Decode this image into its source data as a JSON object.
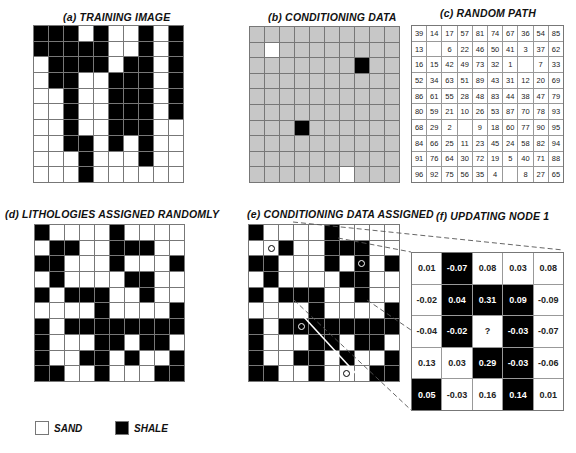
{
  "panels": {
    "a": {
      "title": "(a)  TRAINING IMAGE",
      "rows": [
        "BBBWBWWBWB",
        "BBBBBWWBWB",
        "WBBBBWBBWB",
        "WBBWWBBBWB",
        "WWBWWBBBWB",
        "WWBWWBBBWB",
        "WWBWWBBBWW",
        "WWBBWBWBWW",
        "WWWBWWWBWW",
        "WWWBWWWWWW"
      ]
    },
    "b": {
      "title": "(b)  CONDITIONING  DATA",
      "rows": [
        "GGGGGGGGGG",
        "GWGGGGGGGG",
        "GGGGGGGBGG",
        "GGGGGGGGGG",
        "GGGGGGGGGG",
        "GGGGGGGGGG",
        "GGGBGGGGGG",
        "GGGGGGGGGG",
        "GGGGGGGGGG",
        "GGGGGGWGGG"
      ]
    },
    "c": {
      "title": "(c)  RANDOM  PATH",
      "rows": [
        [
          "39",
          "14",
          "17",
          "57",
          "81",
          "74",
          "67",
          "36",
          "54",
          "85"
        ],
        [
          "13",
          "",
          "6",
          "22",
          "46",
          "50",
          "41",
          "3",
          "37",
          "62"
        ],
        [
          "16",
          "15",
          "42",
          "49",
          "73",
          "32",
          "1",
          "",
          "7",
          "33"
        ],
        [
          "52",
          "34",
          "63",
          "51",
          "89",
          "43",
          "31",
          "12",
          "20",
          "69"
        ],
        [
          "86",
          "61",
          "55",
          "28",
          "48",
          "83",
          "44",
          "38",
          "47",
          "79"
        ],
        [
          "80",
          "59",
          "21",
          "10",
          "26",
          "53",
          "87",
          "70",
          "78",
          "93"
        ],
        [
          "68",
          "29",
          "2",
          "",
          "9",
          "18",
          "60",
          "77",
          "90",
          "95"
        ],
        [
          "84",
          "66",
          "25",
          "11",
          "23",
          "45",
          "24",
          "58",
          "82",
          "94"
        ],
        [
          "91",
          "76",
          "64",
          "30",
          "72",
          "19",
          "5",
          "40",
          "71",
          "88"
        ],
        [
          "96",
          "92",
          "75",
          "56",
          "35",
          "4",
          "",
          "8",
          "27",
          "65"
        ]
      ]
    },
    "d": {
      "title": "(d)  LITHOLOGIES  ASSIGNED  RANDOMLY",
      "rows": [
        "BWWWWBWWWW",
        "WBBWWBBBWW",
        "BBWWWBWWWB",
        "WBWWWWBBWW",
        "BWBBBWWBWW",
        "WWWWBWWWWB",
        "BWBBBBBBBB",
        "BWWWBBWBBW",
        "BWWBBWBWWB",
        "BBWWBWWWBB"
      ]
    },
    "e": {
      "title": "(e)  CONDITIONING  DATA  ASSIGNED",
      "rows": [
        "BWWWWBWWWW",
        "WWBWWBBBWW",
        "BBWWWBWBWB",
        "WBWWWWBBWW",
        "BWBBBWWBWW",
        "WWWWBWWWWB",
        "BWBBBBBBBB",
        "BWWWBBWBBW",
        "BWWBBWBWWB",
        "BBWWBWWWBB"
      ],
      "conditioning_marks": [
        [
          1,
          1
        ],
        [
          2,
          7
        ],
        [
          6,
          3
        ],
        [
          9,
          6
        ]
      ]
    },
    "f": {
      "title": "(f)  UPDATING NODE  1",
      "cells": [
        [
          {
            "v": "0.01",
            "c": "W"
          },
          {
            "v": "-0.07",
            "c": "B"
          },
          {
            "v": "0.08",
            "c": "W"
          },
          {
            "v": "0.03",
            "c": "W"
          },
          {
            "v": "0.08",
            "c": "W"
          }
        ],
        [
          {
            "v": "-0.02",
            "c": "W"
          },
          {
            "v": "0.04",
            "c": "B"
          },
          {
            "v": "0.31",
            "c": "B"
          },
          {
            "v": "0.09",
            "c": "B"
          },
          {
            "v": "-0.09",
            "c": "W"
          }
        ],
        [
          {
            "v": "-0.04",
            "c": "W"
          },
          {
            "v": "-0.02",
            "c": "B"
          },
          {
            "v": "?",
            "c": "W"
          },
          {
            "v": "-0.03",
            "c": "B"
          },
          {
            "v": "-0.07",
            "c": "W"
          }
        ],
        [
          {
            "v": "0.13",
            "c": "W"
          },
          {
            "v": "0.03",
            "c": "W"
          },
          {
            "v": "0.29",
            "c": "B"
          },
          {
            "v": "-0.03",
            "c": "B"
          },
          {
            "v": "-0.06",
            "c": "W"
          }
        ],
        [
          {
            "v": "0.05",
            "c": "B"
          },
          {
            "v": "-0.03",
            "c": "W"
          },
          {
            "v": "0.16",
            "c": "W"
          },
          {
            "v": "0.14",
            "c": "B"
          },
          {
            "v": "0.01",
            "c": "W"
          }
        ]
      ]
    }
  },
  "legend": {
    "sand_label": "SAND",
    "shale_label": "SHALE",
    "sand_color": "#ffffff",
    "shale_color": "#000000"
  },
  "colors": {
    "unknown_gray": "#c7c7c7",
    "grid_line": "#777777"
  }
}
